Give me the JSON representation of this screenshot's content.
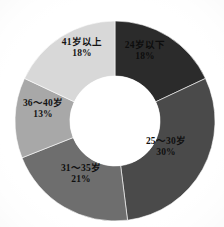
{
  "chart_data": {
    "type": "pie",
    "variant": "donut",
    "title": "",
    "subtitle": "",
    "xlabel": "",
    "ylabel": "",
    "grid": false,
    "legend": "none",
    "labels_inside_slices": true,
    "start_angle_deg": 0,
    "direction": "clockwise",
    "units": "percent",
    "total": 100,
    "categories": [
      "24岁以下",
      "25～30岁",
      "31～35岁",
      "36～40岁",
      "41岁以上"
    ],
    "values": [
      18,
      30,
      21,
      13,
      18
    ],
    "value_labels": [
      "18%",
      "30%",
      "21%",
      "13%",
      "18%"
    ],
    "colors": [
      "#2b2b2b",
      "#4a4a4a",
      "#6e6e6e",
      "#a8a8a8",
      "#d8d8d8"
    ],
    "slices": [
      {
        "label": "24岁以下",
        "value": 18,
        "value_label": "18%",
        "color": "#2b2b2b",
        "label_color": "#0d0d0d"
      },
      {
        "label": "25～30岁",
        "value": 30,
        "value_label": "30%",
        "color": "#4a4a4a",
        "label_color": "#101010"
      },
      {
        "label": "31～35岁",
        "value": 21,
        "value_label": "21%",
        "color": "#6e6e6e",
        "label_color": "#0f0f0f"
      },
      {
        "label": "36～40岁",
        "value": 13,
        "value_label": "13%",
        "color": "#a8a8a8",
        "label_color": "#141414"
      },
      {
        "label": "41岁以上",
        "value": 18,
        "value_label": "18%",
        "color": "#d8d8d8",
        "label_color": "#141414"
      }
    ]
  },
  "geometry": {
    "center_x": 115,
    "center_y": 121,
    "outer_radius": 100,
    "inner_radius": 45,
    "hole_color": "#ffffff",
    "background": "#ffffff"
  }
}
